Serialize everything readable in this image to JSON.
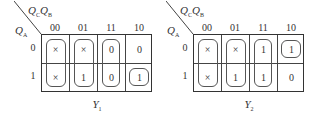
{
  "maps": [
    {
      "id": "Y1",
      "function_label": "Y",
      "function_sub": "1",
      "col_var": {
        "v1": "Q",
        "s1": "C",
        "v2": "Q",
        "s2": "B"
      },
      "row_var": {
        "v": "Q",
        "s": "A"
      },
      "col_headers": [
        "00",
        "01",
        "11",
        "10"
      ],
      "row_headers": [
        "0",
        "1"
      ],
      "cells": [
        [
          "×",
          "×",
          "0",
          "0"
        ],
        [
          "×",
          "1",
          "0",
          "1"
        ]
      ],
      "loops": [
        "col 00 rows 0-1",
        "col 01 rows 0-1",
        "col 11 rows 0-1",
        "cell row1 col10"
      ]
    },
    {
      "id": "Y2",
      "function_label": "Y",
      "function_sub": "2",
      "col_var": {
        "v1": "Q",
        "s1": "C",
        "v2": "Q",
        "s2": "B"
      },
      "row_var": {
        "v": "Q",
        "s": "A"
      },
      "col_headers": [
        "00",
        "01",
        "11",
        "10"
      ],
      "row_headers": [
        "0",
        "1"
      ],
      "cells": [
        [
          "×",
          "×",
          "1",
          "1"
        ],
        [
          "×",
          "1",
          "1",
          "0"
        ]
      ],
      "loops": [
        "col 00 rows 0-1",
        "col 01 rows 0-1",
        "col 11 rows 0-1",
        "cell row0 col10"
      ]
    }
  ]
}
